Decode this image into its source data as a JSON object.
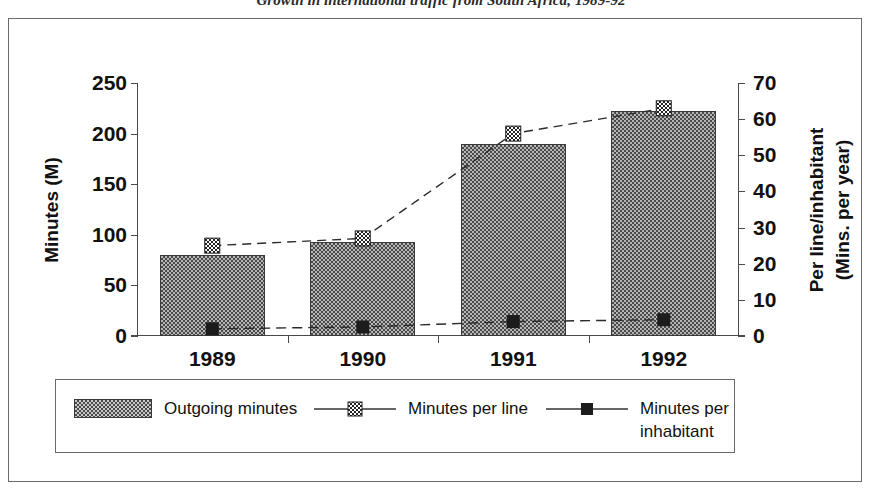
{
  "chart_data": {
    "type": "bar",
    "title": "Growth in international traffic from South Africa, 1989-92",
    "categories": [
      "1989",
      "1990",
      "1991",
      "1992"
    ],
    "xlabel": "",
    "grid": false,
    "legend_position": "bottom",
    "axes": {
      "left": {
        "label_line1": "Minutes (M)",
        "ticks": [
          "0",
          "50",
          "100",
          "150",
          "200",
          "250"
        ],
        "tick_values": [
          0,
          50,
          100,
          150,
          200,
          250
        ],
        "ylim": [
          0,
          250
        ]
      },
      "right": {
        "label_line1": "Per line/inhabitant",
        "label_line2": "(Mins. per year)",
        "ticks": [
          "0",
          "10",
          "20",
          "30",
          "40",
          "50",
          "60",
          "70"
        ],
        "tick_values": [
          0,
          10,
          20,
          30,
          40,
          50,
          60,
          70
        ],
        "ylim": [
          0,
          70
        ]
      }
    },
    "series": [
      {
        "name": "Outgoing minutes",
        "render": "bar",
        "axis": "left",
        "values": [
          80,
          93,
          190,
          222
        ]
      },
      {
        "name": "Minutes per line",
        "render": "line",
        "axis": "right",
        "marker": "checkered-square",
        "values": [
          25,
          27,
          56,
          63
        ]
      },
      {
        "name": "Minutes per inhabitant",
        "render": "line",
        "axis": "right",
        "marker": "solid-square",
        "values": [
          2,
          2.5,
          4,
          4.5
        ]
      }
    ]
  },
  "legend": {
    "items": [
      {
        "label": "Outgoing minutes"
      },
      {
        "label": "Minutes per line"
      },
      {
        "label": "Minutes per inhabitant"
      }
    ]
  },
  "colors": {
    "bar_fill": "#b5b5b5",
    "bar_pattern": "#4a4a4a",
    "axis": "#4a4a4a",
    "text": "#111111",
    "frame": "#6a6a6a",
    "background": "#ffffff"
  }
}
